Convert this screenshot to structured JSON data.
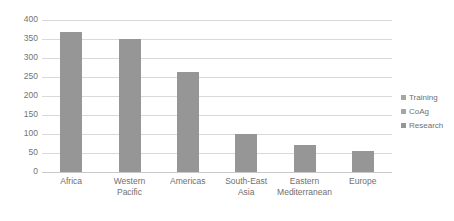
{
  "chart_data": {
    "type": "bar",
    "title": "",
    "xlabel": "",
    "ylabel": "",
    "categories": [
      "Africa",
      "Western Pacific",
      "Americas",
      "South-East Asia",
      "Eastern Mediterranean",
      "Europe"
    ],
    "values": [
      368,
      350,
      263,
      100,
      72,
      56
    ],
    "series": [
      {
        "name": "Research",
        "values": [
          368,
          350,
          263,
          100,
          72,
          56
        ],
        "color": "#969696"
      }
    ],
    "ylim": [
      0,
      400
    ],
    "yticks": [
      0,
      50,
      100,
      150,
      200,
      250,
      300,
      350,
      400
    ],
    "ytick_labels": [
      "0",
      "50",
      "100",
      "150",
      "200",
      "250",
      "300",
      "350",
      "400"
    ],
    "grid": true,
    "legend_position": "right",
    "legend": [
      {
        "label": "Training",
        "color": "#a6a6a6"
      },
      {
        "label": "CoAg",
        "color": "#a6a6a6"
      },
      {
        "label": "Research",
        "color": "#969696"
      }
    ]
  },
  "colors": {
    "bar": "#969696",
    "grid": "#d9d9d9",
    "axis": "#c9c9c9",
    "text": "#6f6f6f",
    "background": "#ffffff"
  }
}
